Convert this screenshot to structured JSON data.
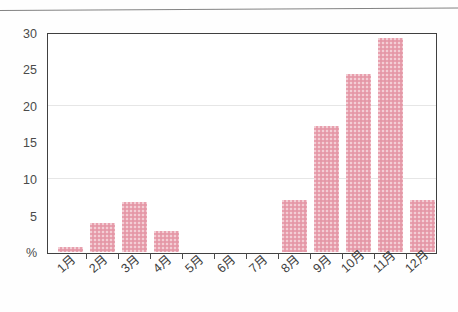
{
  "figure": {
    "background_color": "#fefefe",
    "divider_present": true
  },
  "chart_data": {
    "type": "bar",
    "title": "",
    "subtitle": "",
    "xlabel": "",
    "ylabel": "%",
    "y_axis_unit_label": "%",
    "categories": [
      "1月",
      "2月",
      "3月",
      "4月",
      "5月",
      "6月",
      "7月",
      "8月",
      "9月",
      "10月",
      "11月",
      "12月"
    ],
    "values": [
      0.7,
      4.0,
      7.0,
      3.0,
      0,
      0,
      0,
      7.2,
      17.4,
      24.5,
      29.5,
      7.2
    ],
    "ylim": [
      0,
      30
    ],
    "ytick_labels": [
      "%",
      "5",
      "10",
      "15",
      "20",
      "25",
      "30"
    ],
    "ytick_values": [
      0,
      5,
      10,
      15,
      20,
      25,
      30
    ],
    "ticked_values": [
      5,
      15,
      25
    ],
    "gridline_values": [
      10,
      20
    ],
    "grid": true,
    "legend": false,
    "legend_position": "none",
    "bar_color": "#e8a0ae",
    "axis_color": "#404040",
    "grid_color": "#e6e6e6",
    "xtick_label_rotation_deg": -42
  }
}
